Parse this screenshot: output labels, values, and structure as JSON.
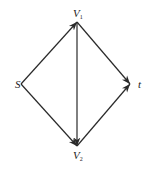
{
  "diagram": {
    "type": "directed-graph",
    "nodes": [
      {
        "id": "S",
        "label": "S",
        "sub": "",
        "x": 21,
        "y": 84,
        "lx": 15,
        "ly": 88
      },
      {
        "id": "V1",
        "label": "V",
        "sub": "1",
        "x": 77,
        "y": 22,
        "lx": 73,
        "ly": 17
      },
      {
        "id": "V2",
        "label": "V",
        "sub": "2",
        "x": 77,
        "y": 146,
        "lx": 73,
        "ly": 159
      },
      {
        "id": "t",
        "label": "t",
        "sub": "",
        "x": 130,
        "y": 84,
        "lx": 138,
        "ly": 88
      }
    ],
    "edges": [
      {
        "from": "S",
        "to": "V1"
      },
      {
        "from": "S",
        "to": "V2"
      },
      {
        "from": "V1",
        "to": "V2"
      },
      {
        "from": "V1",
        "to": "t"
      },
      {
        "from": "V2",
        "to": "t"
      }
    ],
    "colors": {
      "edge": "#2a2a2a",
      "label": "#222222",
      "background": "#ffffff"
    }
  }
}
